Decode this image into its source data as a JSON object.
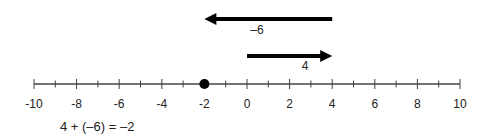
{
  "diagram": {
    "type": "number-line",
    "min": -10,
    "max": 10,
    "major_step": 2,
    "minor_step": 1,
    "tick_labels": [
      "-10",
      "-8",
      "-6",
      "-4",
      "-2",
      "0",
      "2",
      "4",
      "6",
      "8",
      "10"
    ],
    "point": {
      "value": -2,
      "label": "-2"
    },
    "arrows": [
      {
        "name": "add-4",
        "from": 0,
        "to": 4,
        "label": "4",
        "direction": "right"
      },
      {
        "name": "add-neg6",
        "from": 4,
        "to": -2,
        "label": "–6",
        "direction": "left"
      }
    ],
    "equation": "4 + (–6) = –2",
    "colors": {
      "line": "#444444",
      "arrow": "#000000",
      "point": "#000000",
      "text": "#222222"
    }
  }
}
